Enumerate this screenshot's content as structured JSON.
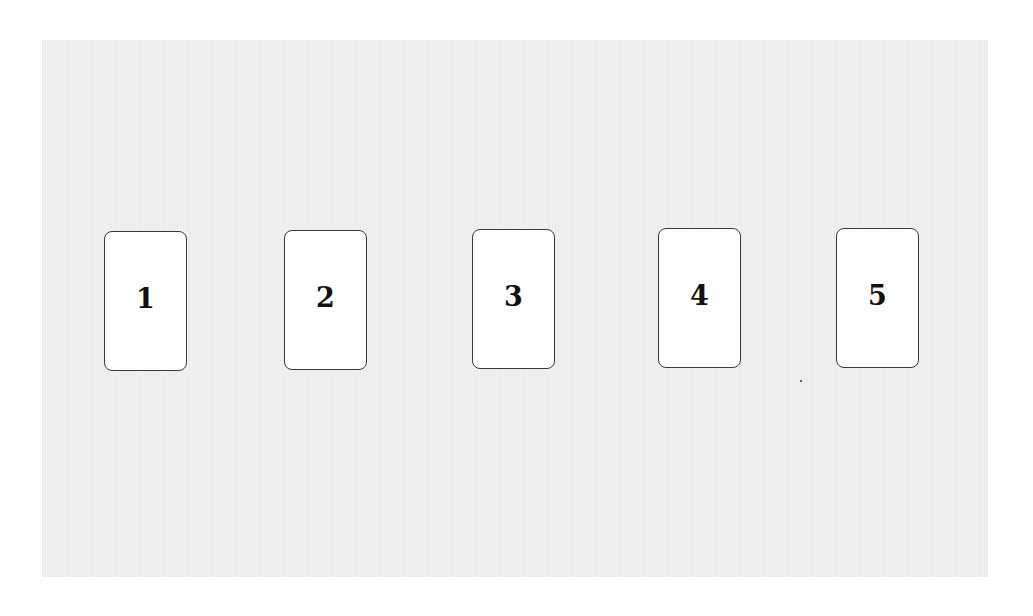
{
  "board": {
    "background_color": "#efefef",
    "cards": [
      {
        "label": "1",
        "x": 104,
        "y": 231
      },
      {
        "label": "2",
        "x": 284,
        "y": 230
      },
      {
        "label": "3",
        "x": 472,
        "y": 229
      },
      {
        "label": "4",
        "x": 658,
        "y": 228
      },
      {
        "label": "5",
        "x": 836,
        "y": 228
      }
    ]
  }
}
